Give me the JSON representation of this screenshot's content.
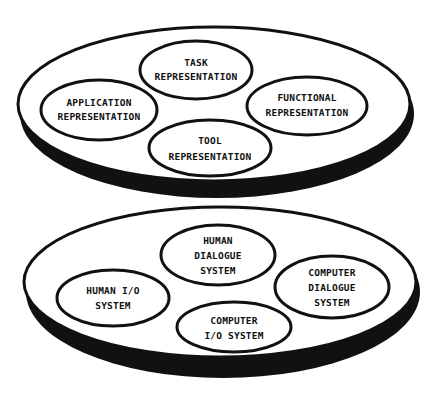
{
  "diagram": {
    "colors": {
      "line": "#111111",
      "fill": "#ffffff",
      "background": "#ffffff"
    },
    "layers": [
      {
        "name": "upper-layer",
        "nodes": [
          {
            "id": "task",
            "lines": [
              "TASK",
              "REPRESENTATION"
            ]
          },
          {
            "id": "application",
            "lines": [
              "APPLICATION",
              "REPRESENTATION"
            ]
          },
          {
            "id": "functional",
            "lines": [
              "FUNCTIONAL",
              "REPRESENTATION"
            ]
          },
          {
            "id": "tool",
            "lines": [
              "TOOL",
              "REPRESENTATION"
            ]
          }
        ]
      },
      {
        "name": "lower-layer",
        "nodes": [
          {
            "id": "human-dialogue",
            "lines": [
              "HUMAN",
              "DIALOGUE",
              "SYSTEM"
            ]
          },
          {
            "id": "human-io",
            "lines": [
              "HUMAN I/O",
              "SYSTEM"
            ]
          },
          {
            "id": "computer-dialogue",
            "lines": [
              "COMPUTER",
              "DIALOGUE",
              "SYSTEM"
            ]
          },
          {
            "id": "computer-io",
            "lines": [
              "COMPUTER",
              "I/O SYSTEM"
            ]
          }
        ]
      }
    ]
  }
}
